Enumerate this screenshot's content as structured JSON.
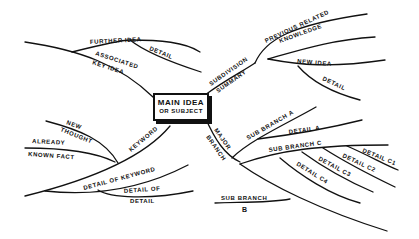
{
  "diagram": {
    "type": "mind-map",
    "center": {
      "line1": "MAIN IDEA",
      "line2": "OR SUBJECT"
    },
    "branches": {
      "associated_key_idea": "ASSOCIATED",
      "associated_key_idea_2": "KEY IDEA",
      "further_idea": "FURTHER IDEA",
      "further_detail": "DETAIL",
      "subdivision": "SUBDIVISION",
      "summary": "SUMMARY",
      "previous_related": "PREVIOUS RELATED",
      "knowledge": "KNOWLEDGE",
      "new_idea": "NEW IDEA",
      "new_idea_detail": "DETAIL",
      "keyword": "KEYWORD",
      "new_thought_1": "NEW",
      "new_thought_2": "THOUGHT",
      "already_1": "ALREADY",
      "already_2": "KNOWN FACT",
      "detail_of_keyword": "DETAIL OF KEYWORD",
      "detail_of_detail_1": "DETAIL OF",
      "detail_of_detail_2": "DETAIL",
      "major": "MAJOR",
      "branch": "BRANCH",
      "sub_branch_a": "SUB BRANCH A",
      "detail_a": "DETAIL A",
      "sub_branch_c": "SUB BRANCH C",
      "detail_c1": "DETAIL C1",
      "detail_c2": "DETAIL C2",
      "detail_c3": "DETAIL C3",
      "detail_c4": "DETAIL C4",
      "sub_branch_b_1": "SUB BRANCH",
      "sub_branch_b_2": "B"
    }
  }
}
